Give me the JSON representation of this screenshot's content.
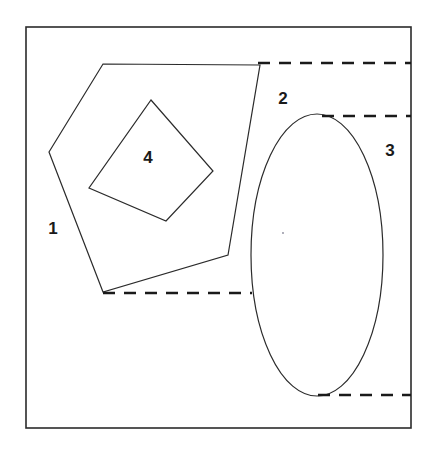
{
  "figure": {
    "background_color": "#ffffff",
    "stroke_color": "#2b2b2b",
    "label_color": "#1a1a1a",
    "frame": {
      "name": "outer-frame",
      "x": 26,
      "y": 27,
      "width": 385,
      "height": 401,
      "stroke_width": 1.6
    },
    "shapes": [
      {
        "name": "pentagon",
        "type": "polygon",
        "points": "103,64 260,65 228,255 103,292 49,152",
        "stroke_width": 1.2,
        "fill": "none"
      },
      {
        "name": "square",
        "type": "polygon",
        "points": "151,100 213,171 166,221 89,188",
        "stroke_width": 1.2,
        "fill": "none"
      },
      {
        "name": "ellipse",
        "type": "ellipse",
        "cx": 317,
        "cy": 255,
        "rx": 66,
        "ry": 141,
        "stroke_width": 1.2,
        "fill": "none"
      }
    ],
    "dashed_lines": [
      {
        "name": "dashed-line-top",
        "x1": 258,
        "y1": 63,
        "x2": 411,
        "y2": 63,
        "stroke_width": 2.6,
        "dash": "12 9"
      },
      {
        "name": "dashed-line-upper-middle",
        "x1": 322,
        "y1": 116,
        "x2": 411,
        "y2": 116,
        "stroke_width": 2.6,
        "dash": "12 9"
      },
      {
        "name": "dashed-line-lower-middle",
        "x1": 103,
        "y1": 293,
        "x2": 252,
        "y2": 293,
        "stroke_width": 2.6,
        "dash": "12 9"
      },
      {
        "name": "dashed-line-bottom",
        "x1": 318,
        "y1": 395,
        "x2": 411,
        "y2": 395,
        "stroke_width": 2.6,
        "dash": "12 9"
      }
    ],
    "dot": {
      "name": "interior-dot",
      "cx": 283,
      "cy": 233,
      "r": 0.9
    },
    "labels": [
      {
        "name": "region-label-1",
        "text": "1",
        "x": 53,
        "y": 228
      },
      {
        "name": "region-label-2",
        "text": "2",
        "x": 283,
        "y": 98
      },
      {
        "name": "region-label-3",
        "text": "3",
        "x": 390,
        "y": 150
      },
      {
        "name": "region-label-4",
        "text": "4",
        "x": 148,
        "y": 157
      }
    ]
  }
}
